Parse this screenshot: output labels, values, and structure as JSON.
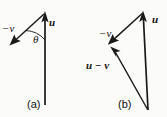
{
  "figure": {
    "background_color": "#fbfbfa",
    "ink_color": "#1a1a1a",
    "width": 167,
    "height": 117,
    "caption_style": "two-panel vector subtraction diagram"
  },
  "panel_a": {
    "panel_label": "(a)",
    "labels": {
      "u": "u",
      "neg_v": "−v",
      "theta": "θ"
    },
    "vectors": [
      {
        "name": "u",
        "label": "u",
        "from": [
          45,
          105
        ],
        "to": [
          45,
          13
        ],
        "arrowhead": "at-tip"
      },
      {
        "name": "neg-v",
        "label": "−v",
        "from": [
          45,
          13
        ],
        "to": [
          11,
          44
        ],
        "arrowhead": "at-tip"
      }
    ],
    "angle_arc": {
      "label": "θ",
      "vertex": [
        45,
        13
      ],
      "between": [
        "u",
        "neg-v"
      ]
    }
  },
  "panel_b": {
    "panel_label": "(b)",
    "labels": {
      "u": "u",
      "neg_v": "−v",
      "u_minus_v": "u − v"
    },
    "vectors": [
      {
        "name": "u",
        "label": "u",
        "from": [
          148,
          110
        ],
        "to": [
          143,
          12
        ],
        "arrowhead": "at-tip"
      },
      {
        "name": "neg-v",
        "label": "−v",
        "from": [
          143,
          12
        ],
        "to": [
          109,
          43
        ],
        "arrowhead": "at-tip"
      },
      {
        "name": "u-minus-v",
        "label": "u − v",
        "from": [
          148,
          110
        ],
        "to": [
          111,
          47
        ],
        "arrowhead": "at-tip"
      }
    ]
  }
}
